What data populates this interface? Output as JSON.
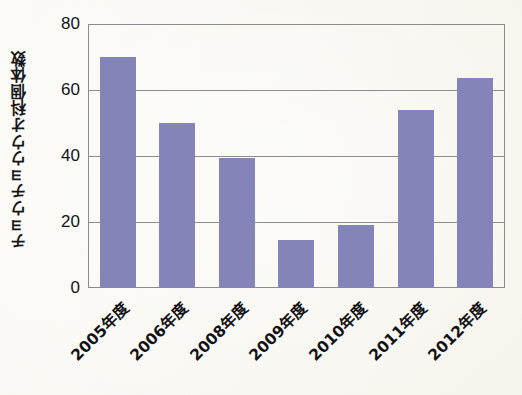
{
  "chart_data": {
    "type": "bar",
    "title": "",
    "subtitle": "",
    "xlabel": "",
    "ylabel": "チョウチョウウオ科個体数",
    "categories": [
      "2005年度",
      "2006年度",
      "2008年度",
      "2009年度",
      "2010年度",
      "2011年度",
      "2012年度"
    ],
    "values": [
      70,
      50,
      39.5,
      14.5,
      19,
      54,
      63.5
    ],
    "series": [
      {
        "name": "チョウチョウウオ科個体数",
        "values": [
          70,
          50,
          39.5,
          14.5,
          19,
          54,
          63.5
        ]
      }
    ],
    "ylim": [
      0,
      80
    ],
    "yticks": [
      0,
      20,
      40,
      60,
      80
    ],
    "ytick_labels": [
      "0",
      "20",
      "40",
      "60",
      "80"
    ],
    "grid": true,
    "grid_axis": "y",
    "legend": false,
    "legend_position": "none",
    "bar_color": "#8584b8",
    "axis_color": "#8c8c8c",
    "background_color": "#fbfaf6",
    "xtick_rotation": -45
  },
  "axes": {
    "y_title": "チョウチョウウオ科個体数",
    "y_tick_labels": [
      "80",
      "60",
      "40",
      "20",
      "0"
    ],
    "x_tick_labels": [
      "2005年度",
      "2006年度",
      "2008年度",
      "2009年度",
      "2010年度",
      "2011年度",
      "2012年度"
    ]
  }
}
